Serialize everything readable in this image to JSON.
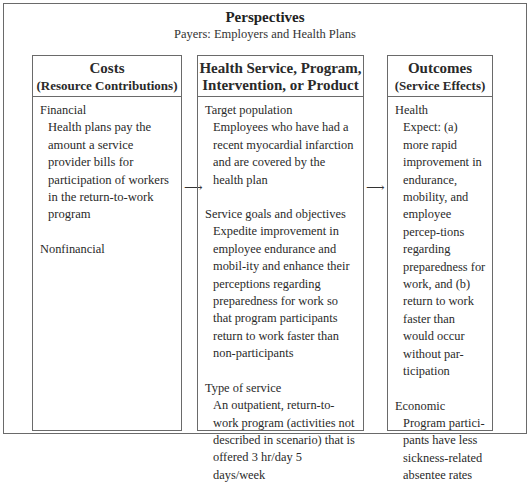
{
  "header": {
    "title": "Perspectives",
    "subtitle": "Payers: Employers and Health Plans"
  },
  "costs": {
    "title": "Costs",
    "subtitle": "(Resource Contributions)",
    "sections": [
      {
        "label": "Financial",
        "text": "Health plans pay the amount a service provider bills for participation of workers in the return-to-work program"
      },
      {
        "label": "Nonfinancial",
        "text": ""
      }
    ]
  },
  "service": {
    "title": "Health Service, Program,",
    "subtitle": "Intervention, or Product",
    "sections": [
      {
        "label": "Target population",
        "text": "Employees who have had a recent myocardial infarction and are covered by the health plan"
      },
      {
        "label": "Service goals and objectives",
        "text": "Expedite improvement in employee endurance and mobil-ity and enhance their perceptions regarding preparedness for work so that program participants return to work faster than non-participants"
      },
      {
        "label": "Type of service",
        "text": "An outpatient, return-to-work program (activities not described in scenario) that is offered 3 hr/day 5 days/week"
      }
    ]
  },
  "outcomes": {
    "title": "Outcomes",
    "subtitle": "(Service Effects)",
    "sections": [
      {
        "label": "Health",
        "text": "Expect: (a) more rapid improvement in endurance, mobility, and employee percep-tions regarding preparedness for work, and (b) return to work faster than would occur without par-ticipation"
      },
      {
        "label": "Economic",
        "text": "Program partici-pants have less sickness-related absentee rates"
      }
    ]
  },
  "arrows": {
    "glyph": "⟶"
  }
}
